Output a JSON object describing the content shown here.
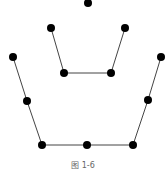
{
  "diagram": {
    "caption": "图 1-6",
    "node_color": "#000000",
    "edge_color": "#444444",
    "nodes": [
      {
        "id": "top",
        "x": 88,
        "y": 3
      },
      {
        "id": "inner-top-left",
        "x": 51,
        "y": 28
      },
      {
        "id": "inner-top-right",
        "x": 125,
        "y": 28
      },
      {
        "id": "inner-bottom-left",
        "x": 64,
        "y": 73
      },
      {
        "id": "inner-bottom-right",
        "x": 111,
        "y": 73
      },
      {
        "id": "outer-top-left",
        "x": 13,
        "y": 57
      },
      {
        "id": "outer-top-right",
        "x": 161,
        "y": 57
      },
      {
        "id": "outer-mid-left",
        "x": 27,
        "y": 101
      },
      {
        "id": "outer-mid-right",
        "x": 148,
        "y": 100
      },
      {
        "id": "outer-bottom-left",
        "x": 42,
        "y": 145
      },
      {
        "id": "outer-bottom-mid",
        "x": 87,
        "y": 145
      },
      {
        "id": "outer-bottom-right",
        "x": 133,
        "y": 145
      }
    ],
    "edges": [
      [
        "inner-top-left",
        "inner-bottom-left"
      ],
      [
        "inner-bottom-left",
        "inner-bottom-right"
      ],
      [
        "inner-bottom-right",
        "inner-top-right"
      ],
      [
        "outer-top-left",
        "outer-mid-left"
      ],
      [
        "outer-mid-left",
        "outer-bottom-left"
      ],
      [
        "outer-bottom-left",
        "outer-bottom-mid"
      ],
      [
        "outer-bottom-mid",
        "outer-bottom-right"
      ],
      [
        "outer-bottom-right",
        "outer-mid-right"
      ],
      [
        "outer-mid-right",
        "outer-top-right"
      ]
    ]
  }
}
